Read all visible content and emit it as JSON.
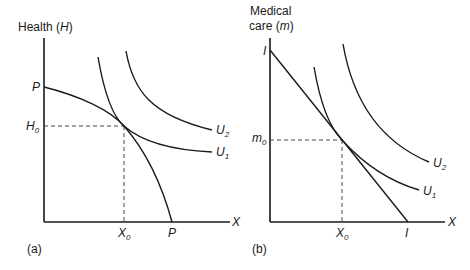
{
  "panels": [
    {
      "id": "a",
      "panel_label": "(a)",
      "y_axis_label": "Health (",
      "y_axis_var": "H",
      "y_axis_close": ")",
      "x_axis_label": "X",
      "y_intercept_label": "P",
      "x_intercept_label": "P",
      "eq_y_label": "H",
      "eq_y_sub": "0",
      "eq_x_label": "X",
      "eq_x_sub": "0",
      "curves": [
        {
          "name": "production-possibility-frontier",
          "label": ""
        },
        {
          "name": "indifference-curve-u1",
          "label": "U",
          "sub": "1"
        },
        {
          "name": "indifference-curve-u2",
          "label": "U",
          "sub": "2"
        }
      ]
    },
    {
      "id": "b",
      "panel_label": "(b)",
      "y_axis_label_line1": "Medical",
      "y_axis_label_line2": "care (",
      "y_axis_var": "m",
      "y_axis_close": ")",
      "x_axis_label": "X",
      "y_intercept_label": "I",
      "x_intercept_label": "I",
      "eq_y_label": "m",
      "eq_y_sub": "0",
      "eq_x_label": "X",
      "eq_x_sub": "0",
      "curves": [
        {
          "name": "budget-line",
          "label": ""
        },
        {
          "name": "indifference-curve-u1",
          "label": "U",
          "sub": "1"
        },
        {
          "name": "indifference-curve-u2",
          "label": "U",
          "sub": "2"
        }
      ]
    }
  ]
}
